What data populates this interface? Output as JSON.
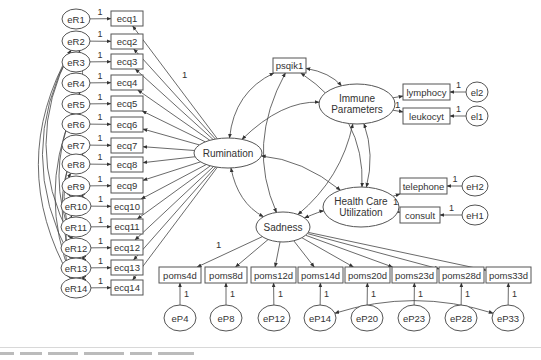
{
  "diagram": {
    "type": "structural-equation-model",
    "latent": [
      {
        "id": "rum",
        "label": "Rumination",
        "cx": 228,
        "cy": 153,
        "rx": 34,
        "ry": 15,
        "lines": [
          "Rumination"
        ]
      },
      {
        "id": "imm",
        "label": "Immune Parameters",
        "cx": 357,
        "cy": 104,
        "rx": 38,
        "ry": 20,
        "lines": [
          "Immune",
          "Parameters"
        ]
      },
      {
        "id": "hcu",
        "label": "Health Care Utilization",
        "cx": 361,
        "cy": 207,
        "rx": 38,
        "ry": 20,
        "lines": [
          "Health Care",
          "Utilization"
        ]
      },
      {
        "id": "sad",
        "label": "Sadness",
        "cx": 283,
        "cy": 227,
        "rx": 27,
        "ry": 15,
        "lines": [
          "Sadness"
        ]
      }
    ],
    "observed": [
      {
        "id": "ecq1",
        "label": "ecq1",
        "x": 111,
        "y": 11,
        "w": 32,
        "h": 15
      },
      {
        "id": "ecq2",
        "label": "ecq2",
        "x": 111,
        "y": 34,
        "w": 32,
        "h": 15
      },
      {
        "id": "ecq3",
        "label": "ecq3",
        "x": 111,
        "y": 54,
        "w": 32,
        "h": 15
      },
      {
        "id": "ecq4",
        "label": "ecq4",
        "x": 111,
        "y": 75,
        "w": 32,
        "h": 15
      },
      {
        "id": "ecq5",
        "label": "ecq5",
        "x": 111,
        "y": 96,
        "w": 32,
        "h": 15
      },
      {
        "id": "ecq6",
        "label": "ecq6",
        "x": 111,
        "y": 117,
        "w": 32,
        "h": 15
      },
      {
        "id": "ecq7",
        "label": "ecq7",
        "x": 111,
        "y": 138,
        "w": 32,
        "h": 15
      },
      {
        "id": "ecq8",
        "label": "ecq8",
        "x": 111,
        "y": 157,
        "w": 32,
        "h": 15
      },
      {
        "id": "ecq9",
        "label": "ecq9",
        "x": 111,
        "y": 178,
        "w": 32,
        "h": 15
      },
      {
        "id": "ecq10",
        "label": "ecq10",
        "x": 111,
        "y": 199,
        "w": 32,
        "h": 15
      },
      {
        "id": "ecq11",
        "label": "ecq11",
        "x": 111,
        "y": 219,
        "w": 32,
        "h": 15
      },
      {
        "id": "ecq12",
        "label": "ecq12",
        "x": 111,
        "y": 240,
        "w": 32,
        "h": 15
      },
      {
        "id": "ecq13",
        "label": "ecq13",
        "x": 111,
        "y": 260,
        "w": 32,
        "h": 15
      },
      {
        "id": "ecq14",
        "label": "ecq14",
        "x": 111,
        "y": 280,
        "w": 32,
        "h": 15
      },
      {
        "id": "psqik1",
        "label": "psqik1",
        "x": 273,
        "y": 58,
        "w": 33,
        "h": 15
      },
      {
        "id": "lymphocy",
        "label": "lymphocy",
        "x": 403,
        "y": 84,
        "w": 47,
        "h": 16
      },
      {
        "id": "leukocyt",
        "label": "leukocyt",
        "x": 403,
        "y": 108,
        "w": 47,
        "h": 16
      },
      {
        "id": "telephone",
        "label": "telephone",
        "x": 400,
        "y": 178,
        "w": 47,
        "h": 16
      },
      {
        "id": "consult",
        "label": "consult",
        "x": 400,
        "y": 207,
        "w": 40,
        "h": 16
      },
      {
        "id": "poms4d",
        "label": "poms4d",
        "x": 159,
        "y": 267,
        "w": 42,
        "h": 16
      },
      {
        "id": "poms8d",
        "label": "poms8d",
        "x": 205,
        "y": 267,
        "w": 42,
        "h": 16
      },
      {
        "id": "poms12d",
        "label": "poms12d",
        "x": 251,
        "y": 267,
        "w": 45,
        "h": 16
      },
      {
        "id": "poms14d",
        "label": "poms14d",
        "x": 298,
        "y": 267,
        "w": 45,
        "h": 16
      },
      {
        "id": "poms20d",
        "label": "poms20d",
        "x": 345,
        "y": 267,
        "w": 45,
        "h": 16
      },
      {
        "id": "poms23d",
        "label": "poms23d",
        "x": 392,
        "y": 267,
        "w": 45,
        "h": 16
      },
      {
        "id": "poms28d",
        "label": "poms28d",
        "x": 439,
        "y": 267,
        "w": 45,
        "h": 16
      },
      {
        "id": "poms33d",
        "label": "poms33d",
        "x": 486,
        "y": 267,
        "w": 45,
        "h": 16
      }
    ],
    "errors": [
      {
        "id": "eR1",
        "label": "eR1",
        "cx": 76,
        "cy": 19,
        "target": "ecq1",
        "loading": "1"
      },
      {
        "id": "eR2",
        "label": "eR2",
        "cx": 76,
        "cy": 41,
        "target": "ecq2",
        "loading": "1"
      },
      {
        "id": "eR3",
        "label": "eR3",
        "cx": 76,
        "cy": 62,
        "target": "ecq3",
        "loading": "1"
      },
      {
        "id": "eR4",
        "label": "eR4",
        "cx": 76,
        "cy": 83,
        "target": "ecq4",
        "loading": "1"
      },
      {
        "id": "eR5",
        "label": "eR5",
        "cx": 76,
        "cy": 104,
        "target": "ecq5",
        "loading": "1"
      },
      {
        "id": "eR6",
        "label": "eR6",
        "cx": 76,
        "cy": 124,
        "target": "ecq6",
        "loading": "1"
      },
      {
        "id": "eR7",
        "label": "eR7",
        "cx": 76,
        "cy": 145,
        "target": "ecq7",
        "loading": "1"
      },
      {
        "id": "eR8",
        "label": "eR8",
        "cx": 76,
        "cy": 164,
        "target": "ecq8",
        "loading": "1"
      },
      {
        "id": "eR9",
        "label": "eR9",
        "cx": 76,
        "cy": 186,
        "target": "ecq9",
        "loading": "1"
      },
      {
        "id": "eR10",
        "label": "eR10",
        "cx": 76,
        "cy": 206,
        "target": "ecq10",
        "loading": "1"
      },
      {
        "id": "eR11",
        "label": "eR11",
        "cx": 76,
        "cy": 227,
        "target": "ecq11",
        "loading": "1"
      },
      {
        "id": "eR12",
        "label": "eR12",
        "cx": 76,
        "cy": 248,
        "target": "ecq12",
        "loading": "1"
      },
      {
        "id": "eR13",
        "label": "eR13",
        "cx": 76,
        "cy": 268,
        "target": "ecq13",
        "loading": "1"
      },
      {
        "id": "eR14",
        "label": "eR14",
        "cx": 76,
        "cy": 288,
        "target": "ecq14",
        "loading": "1"
      },
      {
        "id": "el2",
        "label": "el2",
        "cx": 477,
        "cy": 92,
        "target": "lymphocy",
        "loading": "1"
      },
      {
        "id": "el1",
        "label": "el1",
        "cx": 477,
        "cy": 116,
        "target": "leukocyt",
        "loading": "1"
      },
      {
        "id": "eH2",
        "label": "eH2",
        "cx": 475,
        "cy": 186,
        "target": "telephone",
        "loading": "1"
      },
      {
        "id": "eH1",
        "label": "eH1",
        "cx": 475,
        "cy": 215,
        "target": "consult",
        "loading": "1"
      },
      {
        "id": "eP4",
        "label": "eP4",
        "cx": 180,
        "cy": 318,
        "target": "poms4d",
        "loading": "1"
      },
      {
        "id": "eP8",
        "label": "eP8",
        "cx": 226,
        "cy": 318,
        "target": "poms8d",
        "loading": "1"
      },
      {
        "id": "eP12",
        "label": "eP12",
        "cx": 274,
        "cy": 318,
        "target": "poms12d",
        "loading": "1"
      },
      {
        "id": "eP14",
        "label": "eP14",
        "cx": 320,
        "cy": 318,
        "target": "poms14d",
        "loading": "1"
      },
      {
        "id": "eP20",
        "label": "eP20",
        "cx": 367,
        "cy": 318,
        "target": "poms20d",
        "loading": "1"
      },
      {
        "id": "eP23",
        "label": "eP23",
        "cx": 414,
        "cy": 318,
        "target": "poms23d",
        "loading": "1"
      },
      {
        "id": "eP28",
        "label": "eP28",
        "cx": 461,
        "cy": 318,
        "target": "poms28d",
        "loading": "1"
      },
      {
        "id": "eP33",
        "label": "eP33",
        "cx": 508,
        "cy": 318,
        "target": "poms33d",
        "loading": "1"
      }
    ],
    "fixed_loadings": [
      {
        "label": "1",
        "x": 182,
        "y": 78,
        "note": "Rumination -> ecq1"
      },
      {
        "label": "1",
        "x": 216,
        "y": 248,
        "note": "Sadness -> poms4d"
      },
      {
        "label": "1",
        "x": 395,
        "y": 108,
        "note": "Immune Parameters -> leukocyt"
      },
      {
        "label": "1",
        "x": 393,
        "y": 205,
        "note": "Health Care Utilization -> consult"
      }
    ],
    "covariances": [
      [
        "eR2",
        "eR5"
      ],
      [
        "eR7",
        "eR8"
      ],
      [
        "eR9",
        "eR10"
      ],
      [
        "eR12",
        "eR13"
      ],
      [
        "eR13",
        "eR14"
      ],
      [
        "eR2",
        "eR12"
      ],
      [
        "eR2",
        "eR13"
      ],
      [
        "eR2",
        "eR14"
      ],
      [
        "eR5",
        "eR12"
      ],
      [
        "eR5",
        "eR14"
      ],
      [
        "eR7",
        "eR12"
      ],
      [
        "eR7",
        "eR13"
      ],
      [
        "eR8",
        "eR10"
      ],
      [
        "eR10",
        "eR14"
      ],
      [
        "eP14",
        "eP33"
      ],
      [
        "psqik1",
        "rum"
      ],
      [
        "psqik1",
        "imm"
      ],
      [
        "psqik1",
        "sad"
      ],
      [
        "psqik1",
        "hcu"
      ],
      [
        "rum",
        "imm"
      ],
      [
        "rum",
        "hcu"
      ],
      [
        "rum",
        "sad"
      ],
      [
        "imm",
        "hcu"
      ],
      [
        "imm",
        "sad"
      ],
      [
        "sad",
        "hcu"
      ]
    ]
  },
  "caption": {
    "visible": "partially cut off at bottom edge (unreadable)"
  }
}
